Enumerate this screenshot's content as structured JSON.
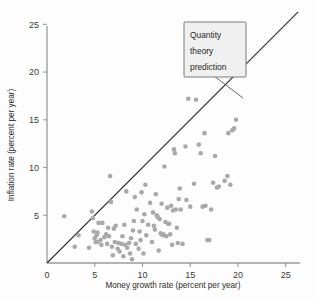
{
  "figure": {
    "name": "money-growth-inflation-scatter",
    "background_color": "#fdfdfd",
    "marker_color": "#a9a9a9",
    "line_color": "#333333",
    "annotation_box_fill": "#f0f0f0",
    "annotation_box_stroke": "#6d6d6d"
  },
  "annotation": {
    "line1": "Quantity",
    "line2": "theory",
    "line3": "prediction"
  },
  "chart_data": {
    "type": "scatter",
    "title": "",
    "xlabel": "Money growth rate (percent per year)",
    "ylabel": "Inflation rate (percent per year)",
    "xlim": [
      0,
      26.5
    ],
    "ylim": [
      0,
      26.5
    ],
    "xticks": [
      0,
      5,
      10,
      15,
      20,
      25
    ],
    "yticks": [
      5,
      10,
      15,
      20,
      25
    ],
    "xticklabels": [
      "0",
      "5",
      "10",
      "15",
      "20",
      "25"
    ],
    "yticklabels": [
      "5",
      "10",
      "15",
      "20",
      "25"
    ],
    "grid": false,
    "legend": false,
    "annotations": [
      {
        "text": "Quantity theory prediction",
        "x": 17.0,
        "y": 23.0,
        "points_to_x": 20.5,
        "points_to_y": 20.5
      }
    ],
    "reference_line": {
      "name": "Quantity theory prediction",
      "type": "identity",
      "slope": 1,
      "intercept": 0,
      "x_start": 0,
      "x_end": 26.3,
      "y_start": 0,
      "y_end": 26.3
    },
    "series": [
      {
        "name": "Countries",
        "marker": "circle",
        "color": "#a9a9a9",
        "points": [
          [
            1.8,
            4.9
          ],
          [
            2.9,
            1.7
          ],
          [
            3.3,
            2.9
          ],
          [
            4.4,
            1.6
          ],
          [
            4.7,
            5.4
          ],
          [
            4.8,
            4.7
          ],
          [
            4.9,
            3.3
          ],
          [
            5.0,
            2.6
          ],
          [
            5.1,
            2.2
          ],
          [
            5.2,
            2.9
          ],
          [
            5.3,
            3.2
          ],
          [
            5.3,
            2.2
          ],
          [
            5.4,
            4.2
          ],
          [
            5.6,
            2.4
          ],
          [
            5.7,
            1.9
          ],
          [
            5.8,
            4.2
          ],
          [
            6.0,
            2.7
          ],
          [
            6.2,
            3.0
          ],
          [
            6.3,
            2.0
          ],
          [
            6.4,
            3.7
          ],
          [
            6.5,
            2.8
          ],
          [
            6.6,
            9.1
          ],
          [
            6.7,
            6.4
          ],
          [
            6.8,
            1.7
          ],
          [
            6.9,
            0.8
          ],
          [
            7.0,
            3.6
          ],
          [
            7.1,
            2.2
          ],
          [
            7.2,
            3.9
          ],
          [
            7.4,
            1.5
          ],
          [
            7.5,
            2.1
          ],
          [
            7.6,
            1.2
          ],
          [
            7.8,
            2.0
          ],
          [
            7.9,
            2.8
          ],
          [
            8.0,
            0.7
          ],
          [
            8.1,
            4.0
          ],
          [
            8.2,
            1.9
          ],
          [
            8.3,
            7.5
          ],
          [
            8.4,
            1.6
          ],
          [
            8.6,
            2.1
          ],
          [
            8.7,
            1.0
          ],
          [
            8.8,
            2.6
          ],
          [
            8.9,
            0.4
          ],
          [
            9.0,
            3.4
          ],
          [
            9.1,
            4.4
          ],
          [
            9.2,
            6.9
          ],
          [
            9.3,
            2.0
          ],
          [
            9.4,
            5.6
          ],
          [
            9.6,
            1.5
          ],
          [
            9.7,
            3.3
          ],
          [
            9.8,
            2.4
          ],
          [
            9.9,
            7.4
          ],
          [
            10.0,
            4.4
          ],
          [
            10.1,
            1.0
          ],
          [
            10.2,
            5.1
          ],
          [
            10.3,
            8.2
          ],
          [
            10.4,
            2.9
          ],
          [
            10.6,
            4.0
          ],
          [
            10.8,
            6.3
          ],
          [
            11.0,
            2.2
          ],
          [
            11.1,
            5.3
          ],
          [
            11.2,
            3.9
          ],
          [
            11.3,
            3.5
          ],
          [
            11.4,
            7.2
          ],
          [
            11.5,
            5.0
          ],
          [
            11.6,
            4.8
          ],
          [
            11.7,
            1.3
          ],
          [
            11.8,
            4.6
          ],
          [
            11.9,
            3.1
          ],
          [
            12.0,
            6.2
          ],
          [
            12.1,
            2.9
          ],
          [
            12.2,
            3.0
          ],
          [
            12.3,
            10.1
          ],
          [
            12.4,
            4.3
          ],
          [
            12.5,
            2.8
          ],
          [
            12.6,
            5.8
          ],
          [
            12.7,
            4.1
          ],
          [
            12.8,
            4.1
          ],
          [
            12.9,
            3.0
          ],
          [
            13.0,
            6.0
          ],
          [
            13.1,
            1.9
          ],
          [
            13.2,
            5.5
          ],
          [
            13.3,
            11.9
          ],
          [
            13.4,
            11.5
          ],
          [
            13.5,
            5.6
          ],
          [
            13.6,
            3.7
          ],
          [
            13.7,
            2.1
          ],
          [
            13.8,
            6.7
          ],
          [
            13.9,
            7.8
          ],
          [
            14.0,
            5.6
          ],
          [
            14.2,
            2.0
          ],
          [
            14.5,
            12.2
          ],
          [
            14.6,
            6.6
          ],
          [
            14.8,
            17.2
          ],
          [
            15.0,
            5.9
          ],
          [
            15.4,
            8.3
          ],
          [
            15.6,
            17.1
          ],
          [
            15.9,
            12.4
          ],
          [
            16.1,
            11.5
          ],
          [
            16.3,
            5.9
          ],
          [
            16.5,
            13.6
          ],
          [
            16.6,
            6.0
          ],
          [
            16.8,
            2.4
          ],
          [
            17.0,
            2.4
          ],
          [
            17.2,
            5.6
          ],
          [
            17.4,
            8.4
          ],
          [
            17.6,
            11.2
          ],
          [
            17.8,
            7.9
          ],
          [
            18.0,
            8.0
          ],
          [
            18.6,
            8.6
          ],
          [
            18.9,
            9.1
          ],
          [
            19.0,
            13.6
          ],
          [
            19.2,
            8.2
          ],
          [
            19.4,
            13.9
          ],
          [
            19.6,
            14.1
          ],
          [
            19.8,
            15.0
          ]
        ]
      }
    ]
  }
}
